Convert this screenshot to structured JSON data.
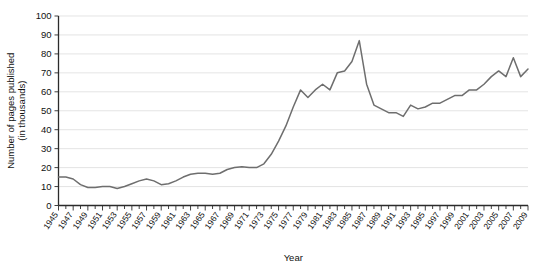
{
  "chart_data": {
    "type": "line",
    "title": "",
    "subtitle": "",
    "xlabel": "Year",
    "ylabel": "Number of pages published\n(in thousands)",
    "ylabel_line1": "Number of pages published",
    "ylabel_line2": "(in thousands)",
    "xlim": [
      1945,
      2009
    ],
    "ylim": [
      0,
      100
    ],
    "ytick_values": [
      0,
      10,
      20,
      30,
      40,
      50,
      60,
      70,
      80,
      90,
      100
    ],
    "ytick_labels": [
      "0",
      "10",
      "20",
      "30",
      "40",
      "50",
      "60",
      "70",
      "80",
      "90",
      "100"
    ],
    "xtick_labels": [
      "1945",
      "1947",
      "1949",
      "1951",
      "1953",
      "1955",
      "1957",
      "1959",
      "1961",
      "1963",
      "1965",
      "1967",
      "1969",
      "1971",
      "1973",
      "1975",
      "1977",
      "1979",
      "1981",
      "1983",
      "1985",
      "1987",
      "1989",
      "1991",
      "1993",
      "1995",
      "1997",
      "1999",
      "2001",
      "2003",
      "2005",
      "2007",
      "2009"
    ],
    "xtick_values": [
      1945,
      1947,
      1949,
      1951,
      1953,
      1955,
      1957,
      1959,
      1961,
      1963,
      1965,
      1967,
      1969,
      1971,
      1973,
      1975,
      1977,
      1979,
      1981,
      1983,
      1985,
      1987,
      1989,
      1991,
      1993,
      1995,
      1997,
      1999,
      2001,
      2003,
      2005,
      2007,
      2009
    ],
    "grid": true,
    "grid_axis": "y",
    "legend": false,
    "legend_position": "none",
    "line_color": "#6e6e6e",
    "grid_color": "#d8d8d8",
    "axis_color": "#2b2b2b",
    "x": [
      1945,
      1946,
      1947,
      1948,
      1949,
      1950,
      1951,
      1952,
      1953,
      1954,
      1955,
      1956,
      1957,
      1958,
      1959,
      1960,
      1961,
      1962,
      1963,
      1964,
      1965,
      1966,
      1967,
      1968,
      1969,
      1970,
      1971,
      1972,
      1973,
      1974,
      1975,
      1976,
      1977,
      1978,
      1979,
      1980,
      1981,
      1982,
      1983,
      1984,
      1985,
      1986,
      1987,
      1988,
      1989,
      1990,
      1991,
      1992,
      1993,
      1994,
      1995,
      1996,
      1997,
      1998,
      1999,
      2000,
      2001,
      2002,
      2003,
      2004,
      2005,
      2006,
      2007,
      2008,
      2009
    ],
    "values": [
      15,
      15,
      14,
      11,
      9.5,
      9.5,
      10,
      10,
      9,
      10,
      11.5,
      13,
      14,
      13,
      11,
      11.5,
      13,
      15,
      16.5,
      17,
      17,
      16.5,
      17,
      19,
      20,
      20.5,
      20,
      20,
      22,
      27,
      34,
      42,
      52,
      61,
      57,
      61,
      64,
      61,
      70,
      71,
      76,
      87,
      64,
      53,
      51,
      49,
      49,
      47,
      53,
      51,
      52,
      54,
      54,
      56,
      58,
      58,
      61,
      61,
      64,
      68,
      71,
      68,
      78,
      68,
      72
    ],
    "series": [
      {
        "name": "Pages published",
        "values": [
          15,
          15,
          14,
          11,
          9.5,
          9.5,
          10,
          10,
          9,
          10,
          11.5,
          13,
          14,
          13,
          11,
          11.5,
          13,
          15,
          16.5,
          17,
          17,
          16.5,
          17,
          19,
          20,
          20.5,
          20,
          20,
          22,
          27,
          34,
          42,
          52,
          61,
          57,
          61,
          64,
          61,
          70,
          71,
          76,
          87,
          64,
          53,
          51,
          49,
          49,
          47,
          53,
          51,
          52,
          54,
          54,
          56,
          58,
          58,
          61,
          61,
          64,
          68,
          71,
          68,
          78,
          68,
          72
        ]
      }
    ]
  }
}
